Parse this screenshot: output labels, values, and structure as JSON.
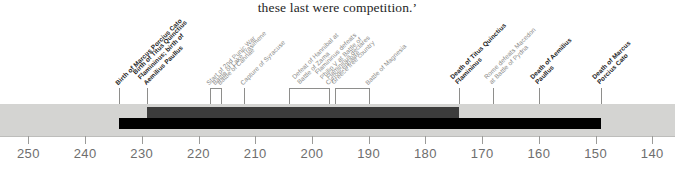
{
  "page": {
    "running_text": "these last were competition.’"
  },
  "timeline": {
    "axis": {
      "era": "BC",
      "ticks": [
        250,
        240,
        230,
        220,
        210,
        200,
        190,
        180,
        170,
        160,
        150,
        140
      ],
      "domain_start": 255,
      "domain_end": 136
    },
    "bands": {
      "background_label": "timeline-background-band",
      "background_color": "#d4d4d2",
      "bars": [
        {
          "name": "titus-quinctius-flamininus-lifespan",
          "color": "#3c3c3c",
          "start_year": 229,
          "end_year": 174,
          "row": "upper"
        },
        {
          "name": "marcus-porcius-cato-lifespan",
          "color": "#000000",
          "start_year": 234,
          "end_year": 149,
          "row": "lower"
        }
      ]
    },
    "events": [
      {
        "id": "birth-marcus-porcius-cato",
        "label": "Birth of Marcus Porcius Cato",
        "year": 234,
        "emphasis": "bold",
        "lines": 1
      },
      {
        "id": "birth-titus-quinctius-flamininus",
        "label": "Birth of Titus Quinctius\nFlamininus; birth of\nAemilius Paullus",
        "year": 229,
        "emphasis": "bold",
        "lines": 3
      },
      {
        "id": "start-second-punic-war",
        "label": "Start of 2nd Punic War",
        "year": 218,
        "emphasis": "light",
        "lines": 1
      },
      {
        "id": "battle-lake-trasimene",
        "label": "Battle of Lake Trasimene",
        "year": 217,
        "emphasis": "light",
        "lines": 1
      },
      {
        "id": "battle-cannae",
        "label": "Battle of Cannae",
        "year": 216,
        "emphasis": "light",
        "lines": 1
      },
      {
        "id": "capture-syracuse",
        "label": "Capture of Syracuse",
        "year": 212,
        "emphasis": "light",
        "lines": 1
      },
      {
        "id": "defeat-hannibal-zama",
        "label": "Defeat of Hannibal at\nBattle of Zama",
        "year": 202,
        "emphasis": "light",
        "lines": 2
      },
      {
        "id": "flamininus-defeats-philip-v",
        "label": "Flamininus defeats\nPhilip V at Battle of\nCynoscephalae",
        "year": 197,
        "emphasis": "light",
        "lines": 3
      },
      {
        "id": "flamininus-declares-greece-free",
        "label": "Flamininus declares\nGreece free country",
        "year": 196,
        "emphasis": "light",
        "lines": 2
      },
      {
        "id": "battle-magnesia",
        "label": "Battle of Magnesia",
        "year": 190,
        "emphasis": "light",
        "lines": 1
      },
      {
        "id": "death-titus-quinctius-flamininus",
        "label": "Death of Titus Quinctius\nFlamininus",
        "year": 174,
        "emphasis": "bold",
        "lines": 2
      },
      {
        "id": "rome-defeats-macedon-pydna",
        "label": "Rome defeats Macedon\nat Battle of Pydna",
        "year": 168,
        "emphasis": "light",
        "lines": 2
      },
      {
        "id": "death-aemilius-paullus",
        "label": "Death of Aemilius\nPaullus",
        "year": 160,
        "emphasis": "bold",
        "lines": 2
      },
      {
        "id": "death-marcus-porcius-cato",
        "label": "Death of Marcus\nPorcius Cato",
        "year": 149,
        "emphasis": "bold",
        "lines": 2
      }
    ],
    "leader_groups": [
      {
        "name": "leader-birth-cato",
        "year": 234,
        "type": "single"
      },
      {
        "name": "leader-birth-flamininus",
        "year": 229,
        "type": "single"
      },
      {
        "name": "leader-punic-war-bracket",
        "from_year": 218,
        "to_year": 216,
        "type": "bracket"
      },
      {
        "name": "leader-capture-syracuse",
        "year": 212,
        "type": "single"
      },
      {
        "name": "leader-zama-bracket",
        "from_year": 204,
        "to_year": 197,
        "type": "bracket"
      },
      {
        "name": "leader-greece-free-bracket",
        "from_year": 196,
        "to_year": 190,
        "type": "bracket"
      },
      {
        "name": "leader-death-flamininus",
        "year": 174,
        "type": "single"
      },
      {
        "name": "leader-pydna",
        "year": 168,
        "type": "single"
      },
      {
        "name": "leader-death-paullus",
        "year": 160,
        "type": "single"
      },
      {
        "name": "leader-death-cato",
        "year": 149,
        "type": "single"
      }
    ]
  }
}
